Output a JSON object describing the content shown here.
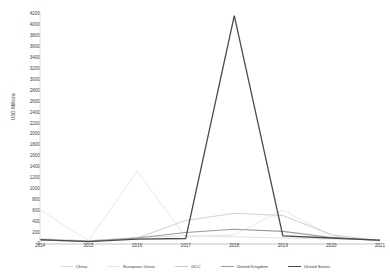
{
  "chart_data": {
    "type": "line",
    "title": "",
    "xlabel": "",
    "ylabel": "USD Millions",
    "categories": [
      "2014",
      "2015",
      "2016",
      "2017",
      "2018",
      "2019",
      "2020",
      "2021"
    ],
    "x": [
      2014,
      2015,
      2016,
      2017,
      2018,
      2019,
      2020,
      2021
    ],
    "ylim": [
      0,
      4200
    ],
    "ytick_step": 200,
    "yticks": [
      0,
      200,
      400,
      600,
      800,
      1000,
      1200,
      1400,
      1600,
      1800,
      2000,
      2200,
      2400,
      2600,
      2800,
      3000,
      3200,
      3400,
      3600,
      3800,
      4000,
      4200
    ],
    "grid": false,
    "legend_position": "bottom",
    "series": [
      {
        "name": "China",
        "color": "#dcdcdc",
        "width": 0.9,
        "values": [
          100,
          60,
          120,
          150,
          130,
          110,
          90,
          70
        ]
      },
      {
        "name": "European Union",
        "color": "#e4e4e4",
        "width": 0.9,
        "values": [
          620,
          60,
          1330,
          130,
          170,
          620,
          150,
          60
        ]
      },
      {
        "name": "GCC",
        "color": "#c9c9c9",
        "width": 0.9,
        "values": [
          80,
          60,
          110,
          430,
          560,
          520,
          170,
          60
        ]
      },
      {
        "name": "United Kingdom",
        "color": "#9a9a9a",
        "width": 1.1,
        "values": [
          70,
          50,
          110,
          210,
          270,
          230,
          120,
          60
        ]
      },
      {
        "name": "United States",
        "color": "#4a4a4a",
        "width": 1.3,
        "values": [
          80,
          45,
          90,
          100,
          4170,
          150,
          110,
          70
        ]
      }
    ]
  }
}
